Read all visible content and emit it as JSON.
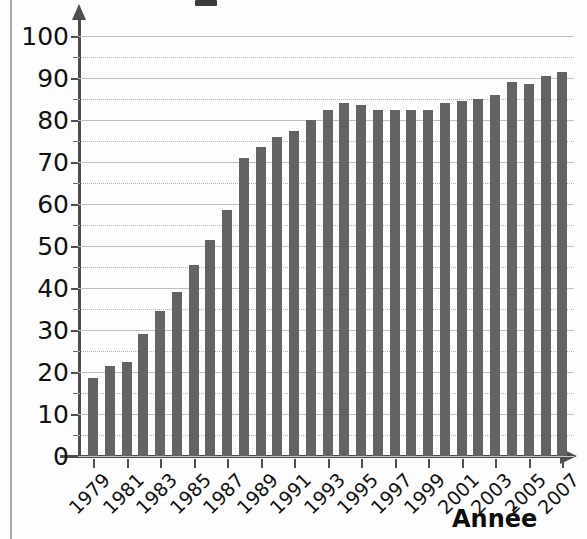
{
  "chart_data": {
    "type": "bar",
    "title": "",
    "xlabel": "Année",
    "ylabel": "",
    "ylim": [
      0,
      100
    ],
    "grid": true,
    "legend": "none",
    "y_major_step": 10,
    "y_minor_step": 5,
    "y_ticks": [
      0,
      10,
      20,
      30,
      40,
      50,
      60,
      70,
      80,
      90,
      100
    ],
    "y_tick_labels": [
      "0",
      "10",
      "20",
      "30",
      "40",
      "50",
      "60",
      "70",
      "80",
      "90",
      "100"
    ],
    "categories": [
      "1979",
      "1980",
      "1981",
      "1982",
      "1983",
      "1984",
      "1985",
      "1986",
      "1987",
      "1988",
      "1989",
      "1990",
      "1991",
      "1992",
      "1993",
      "1994",
      "1995",
      "1996",
      "1997",
      "1998",
      "1999",
      "2000",
      "2001",
      "2002",
      "2003",
      "2004",
      "2005",
      "2006",
      "2007"
    ],
    "x_tick_labels_shown": [
      "1979",
      "1981",
      "1983",
      "1985",
      "1987",
      "1989",
      "1991",
      "1993",
      "1995",
      "1997",
      "1999",
      "2001",
      "2003",
      "2005",
      "2007"
    ],
    "values": [
      18.5,
      21.5,
      22.5,
      29.0,
      34.5,
      39.0,
      45.5,
      51.5,
      58.5,
      71.0,
      73.5,
      76.0,
      77.5,
      80.0,
      82.5,
      84.0,
      83.5,
      82.5,
      82.5,
      82.5,
      82.5,
      84.0,
      84.5,
      85.0,
      86.0,
      89.0,
      88.5,
      90.5,
      91.5
    ],
    "bar_color": "#636363",
    "axis_color": "#4d4d4d",
    "gridline_color": "#b5b5b5",
    "background_color": "#fdfdfd"
  }
}
